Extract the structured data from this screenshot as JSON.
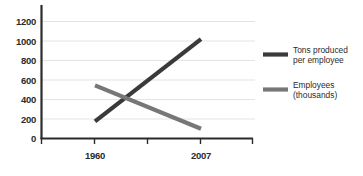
{
  "chart_data": {
    "type": "line",
    "title": "",
    "xlabel": "",
    "ylabel": "",
    "x": [
      "1960",
      "2007"
    ],
    "categories": [
      "1960",
      "2007"
    ],
    "series": [
      {
        "name": "Tons produced per employee",
        "values": [
          175,
          1020
        ],
        "color": "#3a3a3a"
      },
      {
        "name": "Employees (thousands)",
        "values": [
          545,
          100
        ],
        "color": "#777777"
      }
    ],
    "ylim": [
      0,
      1200
    ],
    "yticks": [
      0,
      200,
      400,
      600,
      800,
      1000,
      1200
    ],
    "ytick_labels": [
      "0",
      "200",
      "400",
      "600",
      "800",
      "1000",
      "1200"
    ],
    "xtick_labels": [
      "1960",
      "2007"
    ],
    "grid": true,
    "legend_position": "right"
  },
  "axis": {
    "y_labels": [
      "1200",
      "1000",
      "800",
      "600",
      "400",
      "200",
      "0"
    ],
    "x_labels": [
      "1960",
      "2007"
    ]
  },
  "legend": {
    "entries": [
      {
        "line1": "Tons produced",
        "line2": "per employee",
        "full": "Tons produced per employee",
        "color": "#3a3a3a"
      },
      {
        "line1": "Employees",
        "line2": "(thousands)",
        "full": "Employees (thousands)",
        "color": "#777777"
      }
    ]
  }
}
